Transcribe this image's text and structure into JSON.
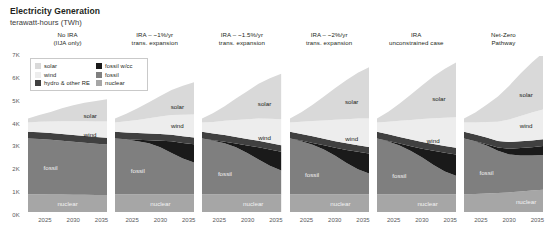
{
  "header": {
    "title": "Electricity Generation",
    "subtitle": "terawatt-hours (TWh)"
  },
  "legend": {
    "left_column": [
      {
        "label": "solar",
        "color": "#d9d9d9"
      },
      {
        "label": "wind",
        "color": "#ededed"
      },
      {
        "label": "hydro & other RE",
        "color": "#404040"
      }
    ],
    "right_column": [
      {
        "label": "fossil w/cc",
        "color": "#1a1a1a"
      },
      {
        "label": "fossil",
        "color": "#7f7f7f"
      },
      {
        "label": "nuclear",
        "color": "#a6a6a6"
      }
    ]
  },
  "chart_data": {
    "type": "area",
    "title": "Electricity Generation",
    "subtitle": "terawatt-hours (TWh)",
    "xlabel": "",
    "ylabel": "terawatt-hours (TWh)",
    "ylim": [
      0,
      7000
    ],
    "yticks": [
      "0K",
      "1K",
      "2K",
      "3K",
      "4K",
      "5K",
      "6K",
      "7K"
    ],
    "ytick_values": [
      0,
      1000,
      2000,
      3000,
      4000,
      5000,
      6000,
      7000
    ],
    "xlim": [
      2022,
      2036
    ],
    "xticks": [
      "2025",
      "2030",
      "2035"
    ],
    "xtick_values": [
      2025,
      2030,
      2035
    ],
    "grid": false,
    "stacked": true,
    "legend_position": "inside-top-left",
    "series_order": [
      "nuclear",
      "fossil",
      "fossil w/cc",
      "hydro & other RE",
      "wind",
      "solar"
    ],
    "series_colors": {
      "nuclear": "#a6a6a6",
      "fossil": "#7f7f7f",
      "fossil w/cc": "#1a1a1a",
      "hydro & other RE": "#404040",
      "wind": "#ededed",
      "solar": "#d9d9d9"
    },
    "x": [
      2022,
      2024,
      2026,
      2028,
      2030,
      2032,
      2034,
      2036
    ],
    "panels": [
      {
        "title": "No IRA\n(IIJA only)",
        "series": [
          {
            "name": "nuclear",
            "values": [
              800,
              800,
              790,
              780,
              775,
              770,
              765,
              760
            ]
          },
          {
            "name": "fossil",
            "values": [
              2500,
              2480,
              2450,
              2420,
              2380,
              2340,
              2300,
              2270
            ]
          },
          {
            "name": "fossil w/cc",
            "values": [
              0,
              0,
              0,
              0,
              0,
              0,
              0,
              0
            ]
          },
          {
            "name": "hydro & other RE",
            "values": [
              300,
              300,
              300,
              300,
              300,
              300,
              300,
              300
            ]
          },
          {
            "name": "wind",
            "values": [
              420,
              470,
              520,
              570,
              620,
              660,
              700,
              730
            ]
          },
          {
            "name": "solar",
            "values": [
              180,
              300,
              430,
              580,
              720,
              830,
              920,
              1000
            ]
          }
        ],
        "labels": [
          {
            "text": "solar",
            "x": 2033,
            "y": 4350
          },
          {
            "text": "wind",
            "x": 2033,
            "y": 3500
          },
          {
            "text": "fossil",
            "x": 2026,
            "y": 2000
          },
          {
            "text": "nuclear",
            "x": 2029,
            "y": 400
          }
        ]
      },
      {
        "title": "IRA – ~1%/yr\ntrans. expansion",
        "series": [
          {
            "name": "nuclear",
            "values": [
              800,
              800,
              800,
              800,
              800,
              800,
              800,
              800
            ]
          },
          {
            "name": "fossil",
            "values": [
              2500,
              2450,
              2380,
              2280,
              2100,
              1850,
              1600,
              1420
            ]
          },
          {
            "name": "fossil w/cc",
            "values": [
              0,
              20,
              60,
              140,
              300,
              520,
              700,
              820
            ]
          },
          {
            "name": "hydro & other RE",
            "values": [
              300,
              300,
              300,
              300,
              300,
              300,
              300,
              300
            ]
          },
          {
            "name": "wind",
            "values": [
              420,
              500,
              590,
              690,
              790,
              880,
              960,
              1030
            ]
          },
          {
            "name": "solar",
            "values": [
              180,
              340,
              520,
              720,
              920,
              1120,
              1300,
              1450
            ]
          }
        ],
        "labels": [
          {
            "text": "solar",
            "x": 2033,
            "y": 4750
          },
          {
            "text": "wind",
            "x": 2033,
            "y": 3900
          },
          {
            "text": "fossil",
            "x": 2026,
            "y": 1900
          },
          {
            "text": "nuclear",
            "x": 2030,
            "y": 400
          }
        ]
      },
      {
        "title": "IRA – ~1.5%/yr\ntrans. expansion",
        "series": [
          {
            "name": "nuclear",
            "values": [
              800,
              800,
              800,
              800,
              800,
              800,
              800,
              800
            ]
          },
          {
            "name": "fossil",
            "values": [
              2500,
              2400,
              2280,
              2100,
              1850,
              1560,
              1280,
              1060
            ]
          },
          {
            "name": "fossil w/cc",
            "values": [
              0,
              20,
              70,
              170,
              330,
              540,
              720,
              840
            ]
          },
          {
            "name": "hydro & other RE",
            "values": [
              300,
              300,
              300,
              300,
              300,
              300,
              300,
              300
            ]
          },
          {
            "name": "wind",
            "values": [
              420,
              520,
              640,
              760,
              880,
              990,
              1080,
              1160
            ]
          },
          {
            "name": "solar",
            "values": [
              180,
              400,
              660,
              960,
              1260,
              1560,
              1820,
              2040
            ]
          }
        ],
        "labels": [
          {
            "text": "solar",
            "x": 2033,
            "y": 4900
          },
          {
            "text": "wind",
            "x": 2033,
            "y": 3350
          },
          {
            "text": "fossil",
            "x": 2026,
            "y": 1750
          },
          {
            "text": "nuclear",
            "x": 2031,
            "y": 400
          }
        ]
      },
      {
        "title": "IRA – ~2%/yr\ntrans. expansion",
        "series": [
          {
            "name": "nuclear",
            "values": [
              800,
              800,
              800,
              800,
              800,
              800,
              800,
              800
            ]
          },
          {
            "name": "fossil",
            "values": [
              2500,
              2380,
              2220,
              2000,
              1720,
              1400,
              1120,
              920
            ]
          },
          {
            "name": "fossil w/cc",
            "values": [
              0,
              25,
              80,
              190,
              360,
              580,
              780,
              900
            ]
          },
          {
            "name": "hydro & other RE",
            "values": [
              300,
              300,
              300,
              300,
              300,
              300,
              300,
              300
            ]
          },
          {
            "name": "wind",
            "values": [
              420,
              540,
              680,
              820,
              960,
              1080,
              1190,
              1280
            ]
          },
          {
            "name": "solar",
            "values": [
              180,
              430,
              730,
              1070,
              1420,
              1760,
              2060,
              2300
            ]
          }
        ],
        "labels": [
          {
            "text": "solar",
            "x": 2033,
            "y": 5000
          },
          {
            "text": "wind",
            "x": 2033,
            "y": 3300
          },
          {
            "text": "fossil",
            "x": 2026,
            "y": 1700
          },
          {
            "text": "nuclear",
            "x": 2031,
            "y": 400
          }
        ]
      },
      {
        "title": "IRA\nunconstrained case",
        "series": [
          {
            "name": "nuclear",
            "values": [
              800,
              800,
              800,
              800,
              800,
              800,
              800,
              800
            ]
          },
          {
            "name": "fossil",
            "values": [
              2500,
              2360,
              2180,
              1940,
              1640,
              1310,
              1020,
              820
            ]
          },
          {
            "name": "fossil w/cc",
            "values": [
              0,
              30,
              90,
              210,
              400,
              640,
              840,
              960
            ]
          },
          {
            "name": "hydro & other RE",
            "values": [
              300,
              300,
              300,
              300,
              300,
              300,
              300,
              300
            ]
          },
          {
            "name": "wind",
            "values": [
              420,
              560,
              720,
              880,
              1030,
              1160,
              1270,
              1370
            ]
          },
          {
            "name": "solar",
            "values": [
              180,
              450,
              780,
              1140,
              1520,
              1880,
              2200,
              2460
            ]
          }
        ],
        "labels": [
          {
            "text": "solar",
            "x": 2033,
            "y": 5100
          },
          {
            "text": "wind",
            "x": 2032,
            "y": 3250
          },
          {
            "text": "fossil",
            "x": 2026,
            "y": 1650
          },
          {
            "text": "nuclear",
            "x": 2031,
            "y": 400
          }
        ]
      },
      {
        "title": "Net-Zero\nPathway",
        "series": [
          {
            "name": "nuclear",
            "values": [
              800,
              810,
              830,
              850,
              880,
              920,
              960,
              1000
            ]
          },
          {
            "name": "fossil",
            "values": [
              2500,
              2350,
              2150,
              1900,
              1700,
              1620,
              1580,
              1560
            ]
          },
          {
            "name": "fossil w/cc",
            "values": [
              0,
              20,
              60,
              140,
              260,
              330,
              370,
              400
            ]
          },
          {
            "name": "hydro & other RE",
            "values": [
              300,
              300,
              300,
              300,
              300,
              300,
              300,
              300
            ]
          },
          {
            "name": "wind",
            "values": [
              420,
              540,
              700,
              860,
              1010,
              1140,
              1250,
              1340
            ]
          },
          {
            "name": "solar",
            "values": [
              180,
              440,
              770,
              1130,
              1520,
              1900,
              2250,
              2550
            ]
          }
        ],
        "labels": [
          {
            "text": "solar",
            "x": 2033,
            "y": 5300
          },
          {
            "text": "wind",
            "x": 2033,
            "y": 3900
          },
          {
            "text": "fossil",
            "x": 2026,
            "y": 1800
          },
          {
            "text": "nuclear",
            "x": 2033,
            "y": 500
          }
        ]
      }
    ]
  }
}
